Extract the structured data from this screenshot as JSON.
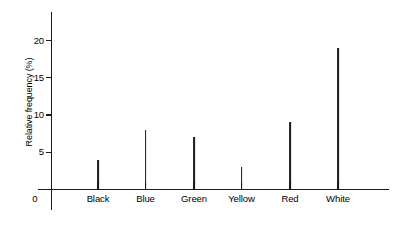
{
  "chart_data": {
    "type": "bar",
    "title": "",
    "subtitle": "",
    "xlabel": "",
    "ylabel": "Relative frequency (%)",
    "categories": [
      "Black",
      "Blue",
      "Green",
      "Yellow",
      "Red",
      "White"
    ],
    "values": [
      4,
      8,
      7,
      3,
      9,
      19
    ],
    "ylim": [
      0,
      23
    ],
    "xlim_note": "categorical axis with origin label 0",
    "y_ticks": [
      5,
      10,
      15,
      20
    ],
    "y_tick_labels": [
      "5",
      "10",
      "15",
      "20"
    ],
    "origin_label": "0",
    "grid": false,
    "legend": false,
    "legend_position": "none",
    "series": [
      {
        "name": "Relative frequency",
        "values": [
          4,
          8,
          7,
          3,
          9,
          19
        ]
      }
    ],
    "style": "vertical spike / needle plot, thin black lines on white background",
    "colors": {
      "line": "#1a1a1a",
      "axis": "#1a1a1a",
      "background": "#ffffff"
    }
  },
  "axis": {
    "y_title": "Relative frequency (%)",
    "ticks": [
      {
        "label": "20",
        "value": 20
      },
      {
        "label": "15",
        "value": 15
      },
      {
        "label": "10",
        "value": 10
      },
      {
        "label": "5",
        "value": 5
      }
    ],
    "origin": "0"
  },
  "bars": [
    {
      "label": "Black",
      "value": 4
    },
    {
      "label": "Blue",
      "value": 8
    },
    {
      "label": "Green",
      "value": 7
    },
    {
      "label": "Yellow",
      "value": 3
    },
    {
      "label": "Red",
      "value": 9
    },
    {
      "label": "White",
      "value": 19
    }
  ]
}
